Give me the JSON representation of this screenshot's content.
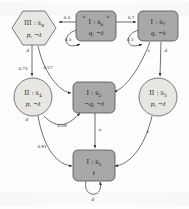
{
  "diagram": {
    "colors": {
      "node_dark": "#a8a8a8",
      "node_light": "#e8e6e3",
      "stroke": "#4f4f4f",
      "edge": "#4a4a4a"
    },
    "nodes": [
      {
        "id": "s8",
        "shape": "hexagon",
        "fill": "light",
        "player": "III",
        "state": "s",
        "index": "8",
        "top_label": "III : s",
        "props": "p, ¬t",
        "cx": 34,
        "cy": 28,
        "w": 46,
        "h": 34
      },
      {
        "id": "s6",
        "shape": "rounded-rect",
        "fill": "dark",
        "player": "I",
        "state": "s",
        "index": "6",
        "top_label": "I : s",
        "props": "q, ¬t",
        "cx": 96,
        "cy": 26,
        "w": 40,
        "h": 30
      },
      {
        "id": "s7",
        "shape": "rounded-rect",
        "fill": "dark",
        "player": "I",
        "state": "s",
        "index": "7",
        "top_label": "I : s",
        "props": "q, ¬t",
        "cx": 158,
        "cy": 26,
        "w": 40,
        "h": 30
      },
      {
        "id": "s4",
        "shape": "circle",
        "fill": "light",
        "player": "II",
        "state": "s",
        "index": "4",
        "top_label": "II : s",
        "props": "p, ¬t",
        "cx": 34,
        "cy": 97,
        "w": 38,
        "h": 38
      },
      {
        "id": "s2",
        "shape": "rounded-rect",
        "fill": "dark",
        "player": "I",
        "state": "s",
        "index": "2",
        "top_label": "I : s",
        "props": "¬q, ¬t",
        "cx": 93,
        "cy": 97,
        "w": 40,
        "h": 30
      },
      {
        "id": "s5",
        "shape": "circle",
        "fill": "light",
        "player": "II",
        "state": "s",
        "index": "5",
        "top_label": "II : s",
        "props": "p, ¬t",
        "cx": 157,
        "cy": 97,
        "w": 38,
        "h": 38
      },
      {
        "id": "s3",
        "shape": "rounded-rect",
        "fill": "dark",
        "player": "I",
        "state": "s",
        "index": "3",
        "top_label": "I : s",
        "props": "t",
        "cx": 93,
        "cy": 165,
        "w": 40,
        "h": 30
      }
    ],
    "edge_labels": {
      "s6_to_s8_prob": "0.5",
      "s6_self_prob": "0.5",
      "s6_to_s7_prob": "0.7",
      "s7_self_prob": "0.3",
      "s8_to_s4_prob": "0.73",
      "s8_to_s2_prob": "0.27",
      "s4_to_s2_prob": "0.09",
      "s4_to_s3_prob": "0.91"
    },
    "action_labels": {
      "a_s6_left": "a",
      "a_s6_right": "a",
      "a_s7_right": "0.7",
      "a_s8_down": "d",
      "a_s4_down": "d",
      "a_s7_to_s2": "c",
      "a_s7_to_s5": "d",
      "a_s2_to_s3": "a",
      "a_s5_to_s3": "c",
      "a_s3_self": "d",
      "a_s6_loop": "0.5",
      "a_s7_loop": "0.3"
    }
  }
}
